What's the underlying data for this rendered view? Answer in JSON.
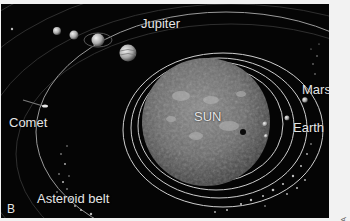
{
  "figure": {
    "panel_letter": "B",
    "credit": "NASA",
    "labels": {
      "sun": "SUN",
      "jupiter": "Jupiter",
      "mars": "Mars",
      "earth": "Earth",
      "comet": "Comet",
      "asteroid_belt": "Asteroid belt"
    }
  }
}
